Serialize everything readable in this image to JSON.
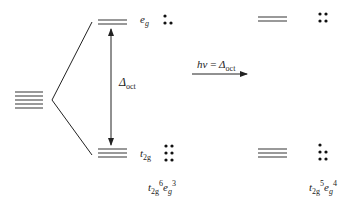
{
  "diagram": {
    "degenerate_levels": {
      "count": 5
    },
    "ground_state": {
      "eg_label": {
        "main": "e",
        "sub": "g"
      },
      "t2g_label": {
        "main": "t",
        "sub": "2g"
      },
      "splitting_label": {
        "symbol": "Δ",
        "sub": "oct"
      },
      "eg_electrons": 3,
      "t2g_electrons": 6,
      "configuration": {
        "t_main": "t",
        "t_sub": "2g",
        "t_sup": "6",
        "e_main": "e",
        "e_sub": "g",
        "e_sup": "3"
      }
    },
    "transition": {
      "label_hv": "hν",
      "equals": " = ",
      "label_delta": "Δ",
      "label_delta_sub": "oct"
    },
    "excited_state": {
      "eg_electrons": 4,
      "t2g_electrons": 5,
      "configuration": {
        "t_main": "t",
        "t_sub": "2g",
        "t_sup": "5",
        "e_main": "e",
        "e_sub": "g",
        "e_sup": "4"
      }
    },
    "colors": {
      "line": "#222222",
      "level": "#555555",
      "dot": "#111111"
    }
  }
}
